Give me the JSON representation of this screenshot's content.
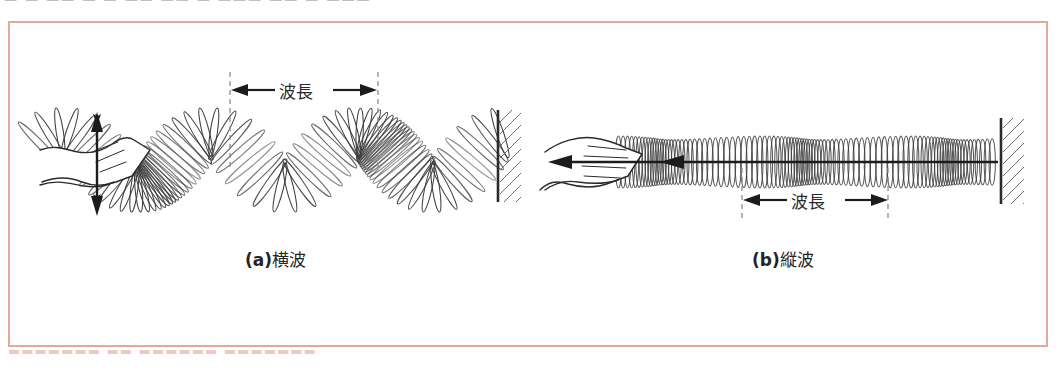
{
  "figure": {
    "kind": "physics-textbook-illustration",
    "frame_color": "#e8a899",
    "ink_color": "#2b2b2b",
    "top_strip_text": "— —  ——  —   — ——  ——   — ———  ——    — ———",
    "bottom_strip_text": "▬▬▬▬▬▬▬ ▬▬ ▬▬▬▬▬▬ ▬▬▬▬▬▬▬"
  },
  "panels": [
    {
      "id": "a",
      "marker": "(a)",
      "title": "横波",
      "caption": "(a)横波",
      "wavelength_label": "波長",
      "hand_motion": "vertical",
      "arrow": {
        "name": "vertical-double-arrow",
        "orientation": "vertical",
        "x": 97,
        "y1": 115,
        "y2": 213
      },
      "dashed_lines_x": [
        230,
        378
      ],
      "wall_x": 497,
      "spring": {
        "x_start": 40,
        "x_end": 500,
        "axis_y": 160,
        "amplitude": 28,
        "wavelength_px": 148,
        "coils": 78,
        "coil_ry": 30
      }
    },
    {
      "id": "b",
      "marker": "(b)",
      "title": "縦波",
      "caption": "(b)縦波",
      "wavelength_label": "波長",
      "hand_motion": "horizontal",
      "arrow": {
        "name": "horizontal-double-arrow",
        "orientation": "horizontal",
        "y": 162,
        "x1": 552,
        "x2": 1000
      },
      "dashed_lines_x": [
        742,
        888
      ],
      "wall_x": 1000,
      "spring": {
        "x_start": 610,
        "x_end": 1000,
        "axis_y": 162,
        "coil_ry": 26,
        "coils": 96,
        "wavelength_px": 146
      }
    }
  ],
  "icons": {
    "hand": "hand-icon",
    "wall": "hatched-wall-icon",
    "spring": "coil-spring-icon",
    "arrow_v": "double-arrow-vertical-icon",
    "arrow_h": "double-arrow-horizontal-icon",
    "dashed": "dashed-guide-line"
  }
}
